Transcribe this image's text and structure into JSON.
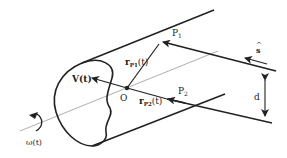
{
  "diagram": {
    "labels": {
      "p1": "P",
      "p1_sub": "1",
      "p2": "P",
      "p2_sub": "2",
      "r_p1": "r",
      "r_p1_sub": "P1",
      "r_p1_arg": "(t)",
      "r_p2": "r",
      "r_p2_sub": "P2",
      "r_p2_arg": "(t)",
      "velocity": "V(t)",
      "origin": "O",
      "omega": "ω(t)",
      "s_hat_hat": "^",
      "s_hat": "s",
      "distance": "d"
    },
    "colors": {
      "stroke": "#222222",
      "axis": "#888888",
      "background": "#ffffff"
    }
  }
}
